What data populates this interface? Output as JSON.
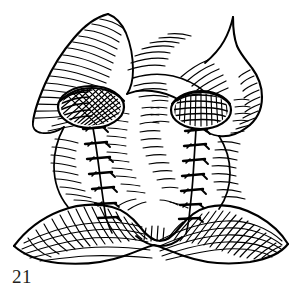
{
  "figure": {
    "caption_number": "21",
    "illustration_style": "pen-and-ink hatched medical illustration",
    "background_color": "#ffffff",
    "ink_color": "#000000",
    "caption_color": "#231f20"
  },
  "illustration": {
    "regions": [
      {
        "name": "upper-left-lobe",
        "label": "left superior lobe",
        "shading": "parallel-hatching",
        "hatch_direction": "diagonal-down-right"
      },
      {
        "name": "upper-right-lobe",
        "label": "right superior lobe",
        "shading": "parallel-hatching",
        "hatch_direction": "diagonal-down-left"
      },
      {
        "name": "left-ostium",
        "label": "left ostium",
        "shading": "dense-cross-hatching",
        "shape": "ellipse"
      },
      {
        "name": "right-ostium",
        "label": "right ostium",
        "shading": "dense-cross-hatching",
        "shape": "ellipse"
      },
      {
        "name": "left-suture-line",
        "label": "left running suture",
        "stitch_count": 7
      },
      {
        "name": "right-suture-line",
        "label": "right running suture",
        "stitch_count": 7
      },
      {
        "name": "inferior-band",
        "label": "inferior wing-shaped band",
        "shading": "grid-cross-hatching"
      }
    ]
  }
}
